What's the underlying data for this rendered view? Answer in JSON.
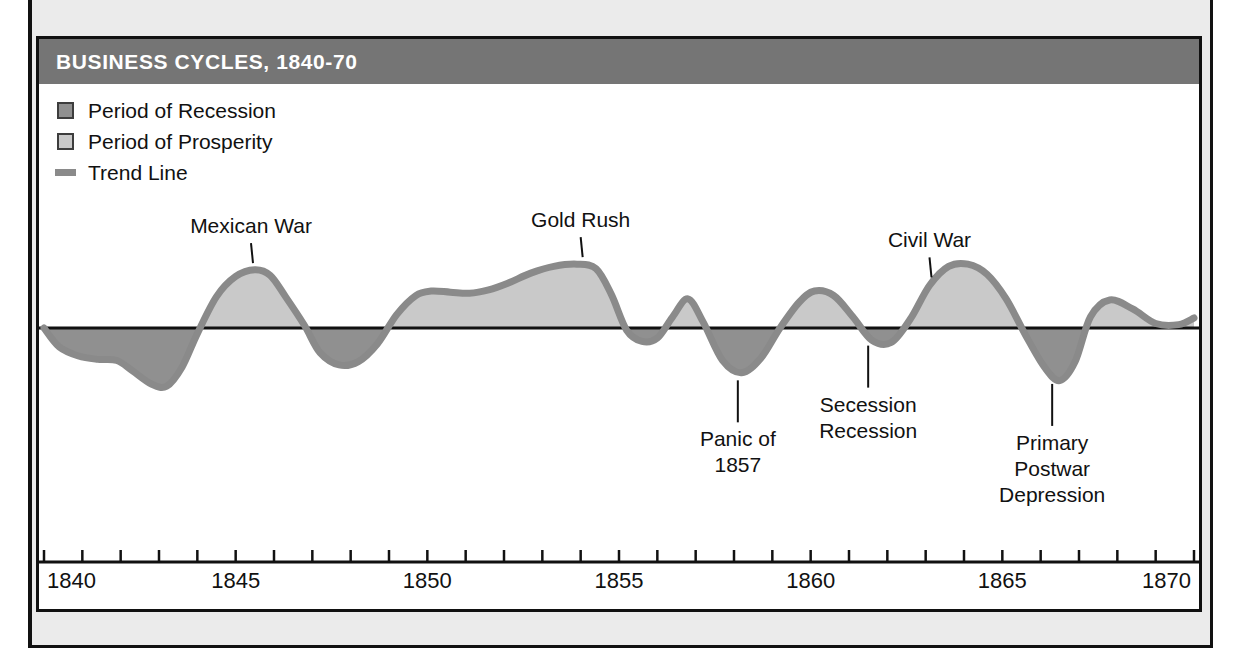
{
  "page": {
    "cutoff_body_text": "economy."
  },
  "figure": {
    "title": "BUSINESS CYCLES, 1840-70",
    "title_bar_color": "#757575",
    "border_color": "#111111",
    "background": "#ffffff"
  },
  "legend": {
    "items": [
      {
        "label": "Period of Recession",
        "swatch": "recession-swatch",
        "color": "#909090"
      },
      {
        "label": "Period of Prosperity",
        "swatch": "prosperity-swatch",
        "color": "#c9c9c9"
      },
      {
        "label": "Trend Line",
        "swatch": "trend-line-swatch",
        "color": "#8a8a8a"
      }
    ]
  },
  "chart_data": {
    "type": "area",
    "title": "BUSINESS CYCLES, 1840-70",
    "xlabel": "",
    "ylabel": "",
    "xlim": [
      1840,
      1870
    ],
    "ylim": [
      -1,
      1
    ],
    "grid": false,
    "legend_position": "top-left",
    "x_tick_labels": [
      "1840",
      "1845",
      "1850",
      "1855",
      "1860",
      "1865",
      "1870"
    ],
    "x_tick_values": [
      1840,
      1845,
      1850,
      1855,
      1860,
      1865,
      1870
    ],
    "x_minor_tick_step": 1,
    "baseline_value": 0,
    "series_name": "Trend Line",
    "colors": {
      "line": "#8a8a8a",
      "above_baseline_fill": "#c9c9c9",
      "below_baseline_fill": "#909090",
      "axis": "#111111"
    },
    "x": [
      1840.0,
      1840.4,
      1840.9,
      1841.4,
      1841.9,
      1842.3,
      1842.8,
      1843.2,
      1843.6,
      1844.0,
      1844.5,
      1845.0,
      1845.5,
      1845.9,
      1846.3,
      1846.8,
      1847.2,
      1847.7,
      1848.2,
      1848.7,
      1849.2,
      1849.7,
      1850.1,
      1850.6,
      1851.1,
      1851.6,
      1852.1,
      1852.7,
      1853.3,
      1853.9,
      1854.4,
      1854.8,
      1855.2,
      1855.6,
      1856.0,
      1856.4,
      1856.8,
      1857.2,
      1857.7,
      1858.2,
      1858.7,
      1859.2,
      1859.7,
      1860.1,
      1860.6,
      1861.1,
      1861.6,
      1862.1,
      1862.6,
      1863.1,
      1863.6,
      1864.1,
      1864.6,
      1865.1,
      1865.6,
      1866.1,
      1866.5,
      1866.9,
      1867.3,
      1867.8,
      1868.4,
      1869.0,
      1869.6,
      1870.0
    ],
    "y": [
      0.0,
      -0.17,
      -0.25,
      -0.28,
      -0.29,
      -0.38,
      -0.5,
      -0.52,
      -0.35,
      -0.05,
      0.28,
      0.46,
      0.52,
      0.47,
      0.28,
      0.02,
      -0.22,
      -0.33,
      -0.3,
      -0.14,
      0.12,
      0.29,
      0.33,
      0.32,
      0.31,
      0.34,
      0.4,
      0.49,
      0.55,
      0.57,
      0.53,
      0.3,
      -0.02,
      -0.12,
      -0.09,
      0.1,
      0.26,
      0.05,
      -0.29,
      -0.4,
      -0.27,
      0.0,
      0.23,
      0.33,
      0.29,
      0.1,
      -0.11,
      -0.13,
      0.08,
      0.38,
      0.55,
      0.57,
      0.48,
      0.26,
      -0.06,
      -0.35,
      -0.47,
      -0.3,
      0.1,
      0.25,
      0.17,
      0.04,
      0.03,
      0.09
    ],
    "annotations": [
      {
        "label": "Mexican War",
        "x": 1845.4,
        "position": "above",
        "lines": [
          "Mexican War"
        ]
      },
      {
        "label": "Gold Rush",
        "x": 1854.0,
        "position": "above",
        "lines": [
          "Gold Rush"
        ]
      },
      {
        "label": "Civil War",
        "x": 1863.1,
        "position": "above",
        "lines": [
          "Civil War"
        ]
      },
      {
        "label": "Panic of 1857",
        "x": 1858.1,
        "position": "below",
        "lines": [
          "Panic of",
          "1857"
        ]
      },
      {
        "label": "Secession Recession",
        "x": 1861.5,
        "position": "below",
        "lines": [
          "Secession",
          "Recession"
        ]
      },
      {
        "label": "Primary Postwar Depression",
        "x": 1866.3,
        "position": "below",
        "lines": [
          "Primary",
          "Postwar",
          "Depression"
        ]
      }
    ]
  }
}
